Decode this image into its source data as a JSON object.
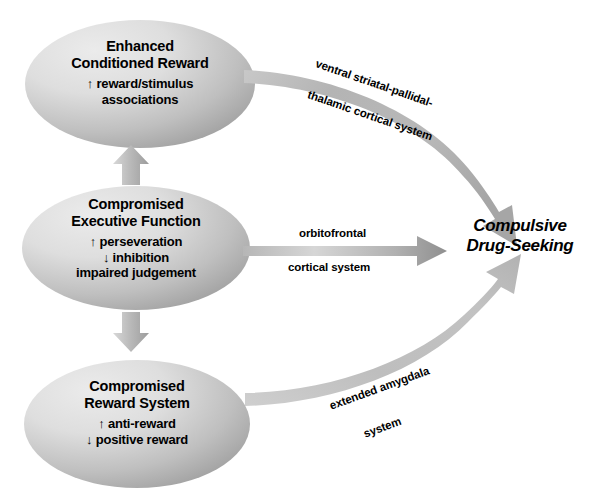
{
  "diagram": {
    "background_color": "#ffffff",
    "text_color": "#000000",
    "node_fill_light": "#e2e2e2",
    "node_fill_dark": "#a0a0a0",
    "arrow_color_light": "#d2d2d2",
    "arrow_color_dark": "#9a9a9a"
  },
  "nodes": [
    {
      "id": "enhanced-conditioned-reward",
      "title_line1": "Enhanced",
      "title_line2": "Conditioned Reward",
      "items": [
        "↑ reward/stimulus",
        "associations"
      ]
    },
    {
      "id": "compromised-executive-function",
      "title_line1": "Compromised",
      "title_line2": "Executive Function",
      "items": [
        "↑ perseveration",
        "↓ inhibition",
        "impaired judgement"
      ]
    },
    {
      "id": "compromised-reward-system",
      "title_line1": "Compromised",
      "title_line2": "Reward System",
      "items": [
        "↑ anti-reward",
        "↓ positive reward"
      ]
    }
  ],
  "outcome": {
    "line1": "Compulsive",
    "line2": "Drug-Seeking"
  },
  "pathways": [
    {
      "id": "ventral-striatal-pallidal-thalamic-cortical",
      "line1": "ventral striatal-pallidal-",
      "line2": "thalamic cortical system",
      "from": "enhanced-conditioned-reward",
      "to": "outcome"
    },
    {
      "id": "orbitofrontal-cortical",
      "line1": "orbitofrontal",
      "line2": "cortical system",
      "from": "compromised-executive-function",
      "to": "outcome"
    },
    {
      "id": "extended-amygdala",
      "line1": "extended amygdala",
      "line2": "system",
      "from": "compromised-reward-system",
      "to": "outcome"
    }
  ],
  "connectors": [
    {
      "id": "exec-to-reward-up",
      "direction": "up"
    },
    {
      "id": "exec-to-reward-down",
      "direction": "down"
    }
  ]
}
